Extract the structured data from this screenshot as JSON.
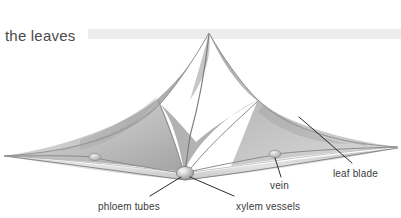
{
  "figure": {
    "title": "the leaves",
    "width": 401,
    "height": 218,
    "background_color": "#ffffff",
    "title_color": "#4a4a4a",
    "banner_color": "#ececec",
    "label_color": "#3a3a3a",
    "leader_line_color": "#2b2b2b",
    "labels": [
      {
        "key": "phloem_tubes",
        "text": "phloem tubes",
        "anchor_x": 185,
        "anchor_y": 175,
        "line_x": 150,
        "line_y": 198
      },
      {
        "key": "xylem_vessels",
        "text": "xylem vessels",
        "anchor_x": 189,
        "anchor_y": 175,
        "line_x": 236,
        "line_y": 197
      },
      {
        "key": "vein",
        "text": "vein",
        "anchor_x": 275,
        "anchor_y": 155,
        "line_x": 280,
        "line_y": 178
      },
      {
        "key": "leaf_blade",
        "text": "leaf blade",
        "anchor_x": 299,
        "anchor_y": 117,
        "line_x": 352,
        "line_y": 164
      }
    ],
    "leaf": {
      "apex_x": 210,
      "apex_y": 32,
      "left_tip_x": 2,
      "left_tip_y": 156,
      "right_tip_x": 398,
      "right_tip_y": 147,
      "center_node_x": 185,
      "center_node_y": 173,
      "left_node_x": 95,
      "left_node_y": 157,
      "right_node_x": 275,
      "right_node_y": 154,
      "fill_light": "#d8d8d8",
      "fill_mid": "#b4b4b4",
      "fill_dark": "#8f8f8f",
      "edge_color": "#9a9a9a",
      "vein_color": "#8c8c8c"
    }
  }
}
